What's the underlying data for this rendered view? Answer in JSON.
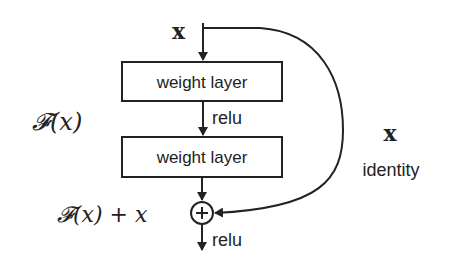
{
  "diagram": {
    "input_label": "x",
    "layers": [
      {
        "label": "weight layer"
      },
      {
        "label": "weight layer"
      }
    ],
    "activation_between": "relu",
    "activation_output": "relu",
    "residual_function_label": "𝓕(x)",
    "sum_label": "𝓕(x) + x",
    "shortcut": {
      "var_label": "x",
      "name_label": "identity"
    },
    "adder_symbol": "+",
    "colors": {
      "stroke": "#222222",
      "background": "#ffffff"
    }
  }
}
